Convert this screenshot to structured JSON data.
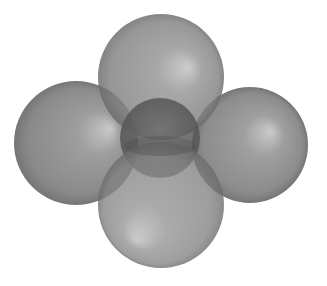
{
  "diagram": {
    "type": "molecular-model",
    "description": "Space-filling model: one central sphere surrounded by four overlapping translucent spheres (top, left, right, bottom)",
    "canvas": {
      "width": 327,
      "height": 286,
      "background": "#ffffff"
    },
    "colors": {
      "sphere_base": "#8a8a8a",
      "sphere_highlight": "#c4c4c4",
      "sphere_edge": "#5e5e5e",
      "center_sphere": "#5f5f5f"
    },
    "spheres": [
      {
        "id": "left",
        "cx": 76,
        "cy": 143,
        "r": 62,
        "highlight": {
          "fx": 0.78,
          "fy": 0.38
        }
      },
      {
        "id": "right",
        "cx": 250,
        "cy": 145,
        "r": 58,
        "highlight": {
          "fx": 0.68,
          "fy": 0.38
        }
      },
      {
        "id": "top",
        "cx": 161,
        "cy": 77,
        "r": 63,
        "highlight": {
          "fx": 0.72,
          "fy": 0.42
        }
      },
      {
        "id": "center",
        "cx": 160,
        "cy": 138,
        "r": 40,
        "highlight": {
          "fx": 0.5,
          "fy": 0.4
        }
      },
      {
        "id": "bottom",
        "cx": 161,
        "cy": 205,
        "r": 63,
        "highlight": {
          "fx": 0.3,
          "fy": 0.75
        }
      }
    ]
  }
}
